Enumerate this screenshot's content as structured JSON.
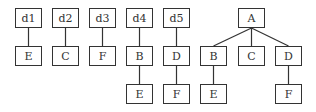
{
  "diagram": {
    "title": "",
    "trees": [
      {
        "id": "t1",
        "nodes": [
          {
            "label": "d1",
            "x": 15,
            "y": 8
          },
          {
            "label": "E",
            "x": 15,
            "y": 46
          }
        ],
        "edges": [
          [
            0,
            1
          ]
        ]
      },
      {
        "id": "t2",
        "nodes": [
          {
            "label": "d2",
            "x": 52,
            "y": 8
          },
          {
            "label": "C",
            "x": 52,
            "y": 46
          }
        ],
        "edges": [
          [
            0,
            1
          ]
        ]
      },
      {
        "id": "t3",
        "nodes": [
          {
            "label": "d3",
            "x": 89,
            "y": 8
          },
          {
            "label": "F",
            "x": 89,
            "y": 46
          }
        ],
        "edges": [
          [
            0,
            1
          ]
        ]
      },
      {
        "id": "t4",
        "nodes": [
          {
            "label": "d4",
            "x": 126,
            "y": 8
          },
          {
            "label": "B",
            "x": 126,
            "y": 46
          },
          {
            "label": "E",
            "x": 126,
            "y": 84
          }
        ],
        "edges": [
          [
            0,
            1
          ],
          [
            1,
            2
          ]
        ]
      },
      {
        "id": "t5",
        "nodes": [
          {
            "label": "d5",
            "x": 163,
            "y": 8
          },
          {
            "label": "D",
            "x": 163,
            "y": 46
          },
          {
            "label": "F",
            "x": 163,
            "y": 84
          }
        ],
        "edges": [
          [
            0,
            1
          ],
          [
            1,
            2
          ]
        ]
      },
      {
        "id": "t6",
        "nodes": [
          {
            "label": "A",
            "x": 238,
            "y": 8
          },
          {
            "label": "B",
            "x": 200,
            "y": 46
          },
          {
            "label": "C",
            "x": 238,
            "y": 46
          },
          {
            "label": "D",
            "x": 275,
            "y": 46
          },
          {
            "label": "E",
            "x": 200,
            "y": 84
          },
          {
            "label": "F",
            "x": 275,
            "y": 84
          }
        ],
        "edges": [
          [
            0,
            1
          ],
          [
            0,
            2
          ],
          [
            0,
            3
          ],
          [
            1,
            4
          ],
          [
            3,
            5
          ]
        ]
      }
    ],
    "colors": {
      "stroke": "#333333",
      "fill": "#ffffff"
    }
  }
}
